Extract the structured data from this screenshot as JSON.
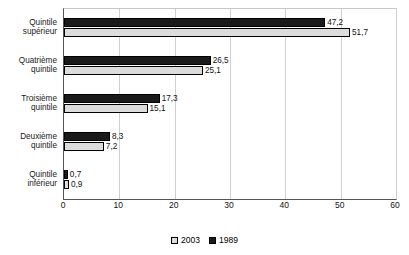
{
  "chart_data": {
    "type": "bar",
    "orientation": "horizontal",
    "title": "",
    "xlabel": "",
    "ylabel": "",
    "xlim": [
      0,
      60
    ],
    "xticks": [
      "0",
      "10",
      "20",
      "30",
      "40",
      "50",
      "60"
    ],
    "grid": true,
    "legend_position": "bottom",
    "categories": [
      [
        "Quintile",
        "supérieur"
      ],
      [
        "Quatrième",
        "quintile"
      ],
      [
        "Troisième",
        "quintile"
      ],
      [
        "Deuxième",
        "quintile"
      ],
      [
        "Quintile",
        "inférieur"
      ]
    ],
    "series": [
      {
        "name": "1989",
        "color": "#1a1a1a",
        "values": [
          47.2,
          26.5,
          17.3,
          8.3,
          0.7
        ],
        "labels": [
          "47,2",
          "26,5",
          "17,3",
          "8,3",
          "0,7"
        ]
      },
      {
        "name": "2003",
        "color": "#dcdcdc",
        "values": [
          51.7,
          25.1,
          15.1,
          7.2,
          0.9
        ],
        "labels": [
          "51,7",
          "25,1",
          "15,1",
          "7,2",
          "0,9"
        ]
      }
    ]
  },
  "legend": {
    "items": [
      {
        "label": "2003",
        "swatch": "light"
      },
      {
        "label": "1989",
        "swatch": "dark"
      }
    ]
  }
}
